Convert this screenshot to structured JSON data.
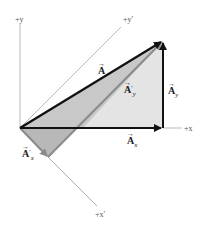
{
  "diagram": {
    "axes": {
      "y": "+y",
      "x": "+x",
      "y_prime": "+y′",
      "x_prime": "+x′"
    },
    "vectors": {
      "A": {
        "name": "A",
        "sub": ""
      },
      "Ax": {
        "name": "A",
        "sub": "x"
      },
      "Ay": {
        "name": "A",
        "sub": "y"
      },
      "Ax_prime": {
        "name": "A",
        "sub": "x",
        "prime": "′"
      },
      "Ay_prime": {
        "name": "A",
        "sub": "y",
        "prime": "′"
      }
    },
    "arrow_glyph": "→",
    "colors": {
      "vector_black": "#111111",
      "vector_gray": "#8a8a8a",
      "fill_dark": "#b8b8b8",
      "fill_light": "#e4e4e4",
      "axis": "#aaaaaa"
    }
  }
}
